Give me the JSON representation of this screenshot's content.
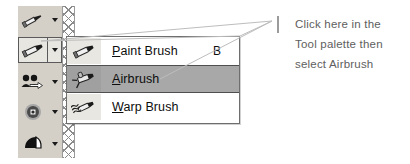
{
  "app": {
    "kind": "paint-program-tool-palette",
    "background_color": "#ffffff"
  },
  "tool_palette": {
    "name": "Tool palette",
    "background_color": "#d4d0c8",
    "selected_index": 1,
    "buttons": [
      {
        "icon": "pen-tool-icon",
        "label": "Pen Tool",
        "has_dropdown": true,
        "selected": false
      },
      {
        "icon": "paint-brush-tool-icon",
        "label": "Paint Brush Tool",
        "has_dropdown": true,
        "selected": true
      },
      {
        "icon": "clone-brush-tool-icon",
        "label": "Clone Brush Tool",
        "has_dropdown": true,
        "selected": false
      },
      {
        "icon": "retouch-tool-icon",
        "label": "Retouch Tool",
        "has_dropdown": true,
        "selected": false
      },
      {
        "icon": "fill-flood-tool-icon",
        "label": "Flood Fill Tool",
        "has_dropdown": true,
        "selected": false
      }
    ],
    "grip_strip": "drag-handle-hatch"
  },
  "flyout_menu": {
    "name": "Brush tool flyout",
    "border_color": "#6e6e6e",
    "background_color": "#ffffff",
    "highlight_color": "#a8a8a8",
    "items": [
      {
        "icon": "paint-brush-icon",
        "label_prefix": "",
        "accelerator": "P",
        "label_suffix": "aint Brush",
        "shortcut": "B",
        "highlighted": false
      },
      {
        "icon": "airbrush-icon",
        "label_prefix": "",
        "accelerator": "A",
        "label_suffix": "irbrush",
        "shortcut": "",
        "highlighted": true
      },
      {
        "icon": "warp-brush-icon",
        "label_prefix": "",
        "accelerator": "W",
        "label_suffix": "arp Brush",
        "shortcut": "",
        "highlighted": false
      }
    ]
  },
  "annotation": {
    "color": "#5e5e5e",
    "leader_color": "#b4b4b4",
    "tick_color": "#9b9b9b",
    "lines": [
      "Click here in the",
      "Tool palette then",
      "select Airbrush"
    ]
  }
}
